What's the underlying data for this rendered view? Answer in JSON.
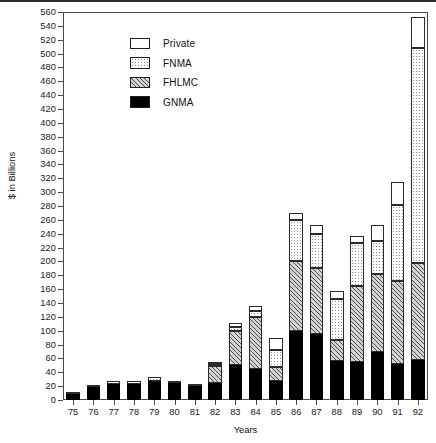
{
  "chart_data": {
    "type": "bar",
    "subtype": "stacked",
    "title": "",
    "xlabel": "Years",
    "ylabel": "$ in Billions",
    "ylim": [
      0,
      560
    ],
    "ytick_step": 20,
    "grid": false,
    "legend_position": "top-left",
    "categories": [
      "75",
      "76",
      "77",
      "78",
      "79",
      "80",
      "81",
      "82",
      "83",
      "84",
      "85",
      "86",
      "87",
      "88",
      "89",
      "90",
      "91",
      "92"
    ],
    "series": [
      {
        "name": "GNMA",
        "swatch": "solid-black",
        "values": [
          9,
          19,
          23,
          23,
          28,
          24,
          20,
          25,
          50,
          45,
          28,
          100,
          95,
          56,
          55,
          70,
          52,
          58
        ]
      },
      {
        "name": "FHLMC",
        "swatch": "diagonal-hatch",
        "values": [
          0,
          0,
          0,
          0,
          0,
          0,
          0,
          24,
          50,
          75,
          20,
          100,
          95,
          30,
          110,
          112,
          120,
          140
        ]
      },
      {
        "name": "FNMA",
        "swatch": "dotted",
        "values": [
          2,
          3,
          4,
          4,
          5,
          4,
          3,
          3,
          5,
          8,
          24,
          60,
          50,
          60,
          62,
          48,
          110,
          310
        ]
      },
      {
        "name": "Private",
        "swatch": "white-open",
        "values": [
          0,
          0,
          0,
          0,
          0,
          0,
          0,
          2,
          6,
          8,
          18,
          10,
          12,
          12,
          10,
          22,
          33,
          45
        ]
      }
    ],
    "series_totals": [
      11,
      22,
      27,
      27,
      33,
      28,
      23,
      54,
      111,
      136,
      90,
      270,
      252,
      158,
      237,
      252,
      315,
      553
    ],
    "axis_note": "Y axis ticks every 20 from 0 to 560"
  },
  "legend": {
    "items": [
      {
        "label": "Private"
      },
      {
        "label": "FNMA"
      },
      {
        "label": "FHLMC"
      },
      {
        "label": "GNMA"
      }
    ]
  },
  "colors": {
    "gnma": "#000000",
    "fhlmc": "#d3d3d3",
    "fnma": "#ffffff",
    "private": "#ffffff",
    "axis": "#4a4a4a",
    "text": "#111111"
  }
}
